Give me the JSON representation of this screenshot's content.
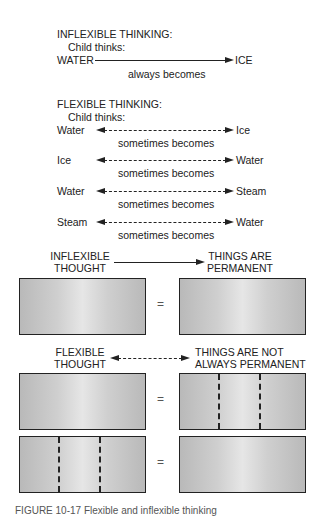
{
  "inflexible": {
    "heading": "INFLEXIBLE THINKING:",
    "sub": "Child thinks:",
    "from": "WATER",
    "to": "ICE",
    "label": "always becomes"
  },
  "flexible": {
    "heading": "FLEXIBLE THINKING:",
    "sub": "Child thinks:",
    "rows": [
      {
        "from": "Water",
        "to": "Ice",
        "label": "sometimes becomes"
      },
      {
        "from": "Ice",
        "to": "Water",
        "label": "sometimes becomes"
      },
      {
        "from": "Water",
        "to": "Steam",
        "label": "sometimes becomes"
      },
      {
        "from": "Steam",
        "to": "Water",
        "label": "sometimes becomes"
      }
    ]
  },
  "diagram": {
    "inflexible_left_l1": "INFLEXIBLE",
    "inflexible_left_l2": "THOUGHT",
    "inflexible_right_l1": "THINGS ARE",
    "inflexible_right_l2": "PERMANENT",
    "flexible_left_l1": "FLEXIBLE",
    "flexible_left_l2": "THOUGHT",
    "flexible_right_l1": "THINGS ARE NOT",
    "flexible_right_l2": "ALWAYS PERMANENT",
    "equals": "="
  },
  "caption": "FIGURE 10-17 Flexible and inflexible thinking"
}
